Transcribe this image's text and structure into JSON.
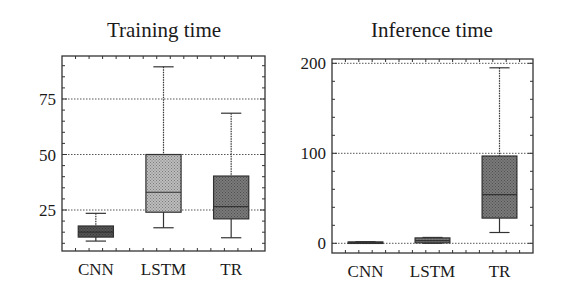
{
  "chart_data": [
    {
      "type": "box",
      "title": "Training time",
      "xlabel": "",
      "ylabel": "",
      "categories": [
        "CNN",
        "LSTM",
        "TR"
      ],
      "ylim": [
        6,
        95
      ],
      "yticks": [
        25,
        50,
        75
      ],
      "grid": true,
      "series": [
        {
          "name": "CNN",
          "whisker_low": 11,
          "q1": 12.8,
          "median": 15,
          "q3": 17.8,
          "whisker_high": 23.5,
          "fill": "#555555"
        },
        {
          "name": "LSTM",
          "whisker_low": 17,
          "q1": 24,
          "median": 33,
          "q3": 50,
          "whisker_high": 89.5,
          "fill": "#bdbdbd"
        },
        {
          "name": "TR",
          "whisker_low": 12.5,
          "q1": 21,
          "median": 26.5,
          "q3": 40.3,
          "whisker_high": 68.6,
          "fill": "#7a7a7a"
        }
      ],
      "frame": {
        "left": 62,
        "top": 56,
        "right": 265,
        "bottom": 251
      },
      "y_px": {
        "v1": 25,
        "p1": 210,
        "v2": 75,
        "p2": 99
      }
    },
    {
      "type": "box",
      "title": "Inference time",
      "xlabel": "",
      "ylabel": "",
      "categories": [
        "CNN",
        "LSTM",
        "TR"
      ],
      "ylim": [
        -10,
        204
      ],
      "yticks": [
        0,
        100,
        200
      ],
      "grid": true,
      "series": [
        {
          "name": "CNN",
          "whisker_low": 0.3,
          "q1": 0.5,
          "median": 1,
          "q3": 1.5,
          "whisker_high": 1.8,
          "fill": "#555555"
        },
        {
          "name": "LSTM",
          "whisker_low": 0,
          "q1": 0.5,
          "median": 3,
          "q3": 6,
          "whisker_high": 6.5,
          "fill": "#7a7a7a"
        },
        {
          "name": "TR",
          "whisker_low": 12,
          "q1": 28,
          "median": 54,
          "q3": 97,
          "whisker_high": 195,
          "fill": "#7a7a7a"
        }
      ],
      "frame": {
        "left": 332,
        "top": 59,
        "right": 533,
        "bottom": 253
      },
      "y_px": {
        "v1": 0,
        "p1": 243.3,
        "v2": 100,
        "p2": 153.3
      }
    }
  ]
}
